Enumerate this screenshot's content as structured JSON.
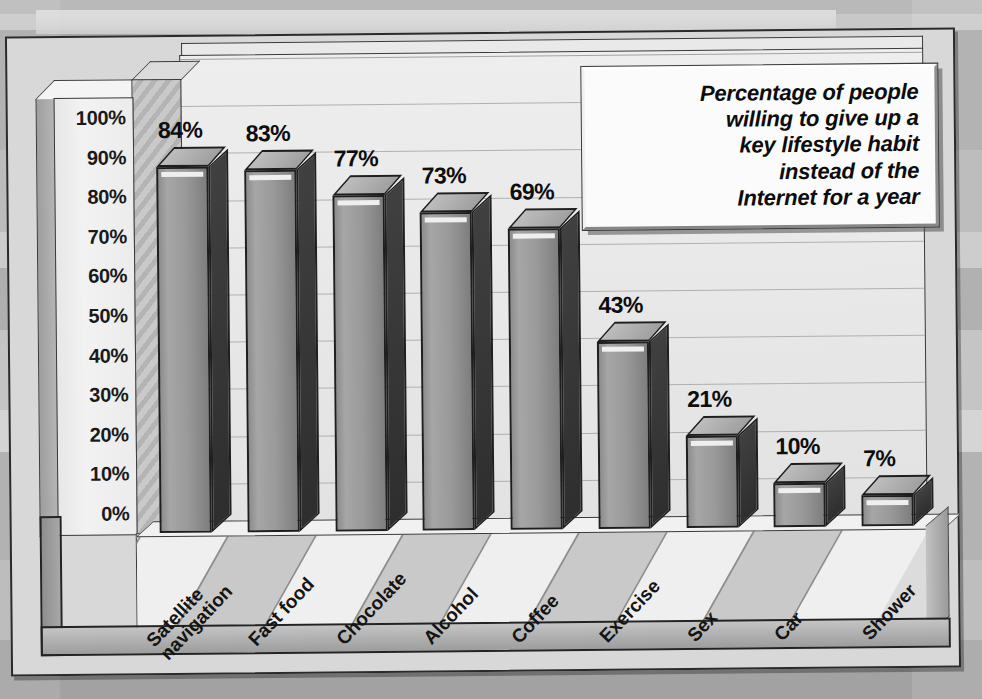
{
  "chart_data": {
    "type": "bar",
    "title": "Percentage of people willing to give up a key lifestyle habit instead of the Internet for a year",
    "title_lines": [
      "Percentage of people",
      "willing to give up a",
      "key lifestyle habit",
      "instead of the",
      "Internet for a year"
    ],
    "categories": [
      "Satellite navigation",
      "Fast food",
      "Chocolate",
      "Alcohol",
      "Coffee",
      "Exercise",
      "Sex",
      "Car",
      "Shower"
    ],
    "category_lines": [
      [
        "Satellite",
        "navigation"
      ],
      [
        "Fast food"
      ],
      [
        "Chocolate"
      ],
      [
        "Alcohol"
      ],
      [
        "Coffee"
      ],
      [
        "Exercise"
      ],
      [
        "Sex"
      ],
      [
        "Car"
      ],
      [
        "Shower"
      ]
    ],
    "values": [
      84,
      83,
      77,
      73,
      69,
      43,
      21,
      10,
      7
    ],
    "value_labels": [
      "84%",
      "83%",
      "77%",
      "73%",
      "69%",
      "43%",
      "21%",
      "10%",
      "7%"
    ],
    "xlabel": "",
    "ylabel": "",
    "ylim": [
      0,
      100
    ],
    "ytick_labels": [
      "100%",
      "90%",
      "80%",
      "70%",
      "60%",
      "50%",
      "40%",
      "30%",
      "20%",
      "10%",
      "0%"
    ],
    "ytick_values": [
      100,
      90,
      80,
      70,
      60,
      50,
      40,
      30,
      20,
      10,
      0
    ],
    "grid": true,
    "grid_axis": "y",
    "legend": false,
    "style": "3d-column",
    "colors": {
      "bar_front": "#9a9a9a",
      "bar_top": "#b0b0b0",
      "bar_side": "#363636",
      "plot_background": "#e8e8e8",
      "outline": "#1e1e1e",
      "text": "#0d0d0d",
      "page_background": "#aeaeae"
    }
  }
}
